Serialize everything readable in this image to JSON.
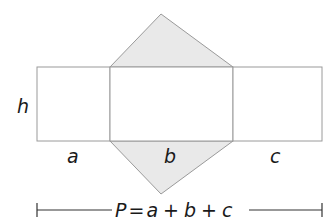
{
  "diagram": {
    "colors": {
      "stroke": "#9a9a9a",
      "triangle_fill": "#e9e9e9",
      "face_fill": "#ffffff",
      "text": "#1a1a1a"
    },
    "faces": [
      {
        "id": "rect-a",
        "label": "a"
      },
      {
        "id": "rect-b",
        "label": "b"
      },
      {
        "id": "rect-c",
        "label": "c"
      }
    ],
    "height_label": "h",
    "formula": {
      "P": "P",
      "eq": "=",
      "a": "a",
      "plus1": "+",
      "b": "b",
      "plus2": "+",
      "c": "c"
    }
  }
}
